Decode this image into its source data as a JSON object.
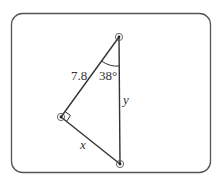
{
  "diagram": {
    "type": "right-triangle",
    "vertices": {
      "top": {
        "x": 119,
        "y": 37
      },
      "left": {
        "x": 61,
        "y": 117
      },
      "bottom": {
        "x": 120,
        "y": 164
      }
    },
    "labels": {
      "hypotenuse_side": "7.8",
      "angle": "38°",
      "vertical_side": "y",
      "bottom_side": "x"
    },
    "right_angle_at": "left",
    "colors": {
      "stroke": "#333333",
      "border": "#555555"
    }
  }
}
